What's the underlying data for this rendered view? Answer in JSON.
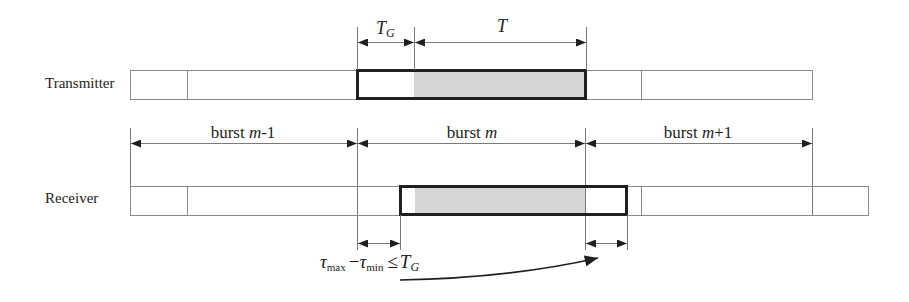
{
  "diagram": {
    "rows": {
      "transmitter": "Transmitter",
      "receiver": "Receiver"
    },
    "top_labels": {
      "guard_interval": {
        "main": "T",
        "sub": "G"
      },
      "symbol_period": {
        "main": "T"
      }
    },
    "bursts": [
      {
        "prefix": "burst ",
        "var": "m",
        "suffix": "-1"
      },
      {
        "prefix": "burst ",
        "var": "m",
        "suffix": ""
      },
      {
        "prefix": "burst ",
        "var": "m",
        "suffix": "+1"
      }
    ],
    "condition": {
      "tau1": "τ",
      "sub1": "max",
      "minus": "−",
      "tau2": "τ",
      "sub2": "min",
      "le": "≤",
      "T": "T",
      "subG": "G"
    },
    "colors": {
      "frame_line": "#8a8a8a",
      "burst_outline": "#1f1f1f",
      "useful_part_fill": "#d6d6d6",
      "text": "#1e1e1e"
    }
  }
}
